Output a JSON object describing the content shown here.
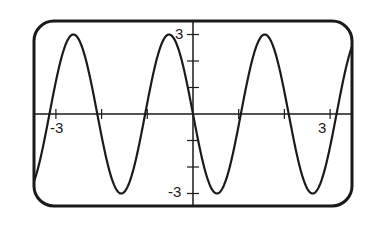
{
  "chart_data": {
    "type": "line",
    "title": "",
    "xlabel": "",
    "ylabel": "",
    "function": "y = -3 sin(3x)",
    "xlim": [
      -3.5,
      3.5
    ],
    "ylim": [
      -3.5,
      3.5
    ],
    "grid": false,
    "legend": null,
    "x_ticks": [
      -3,
      -2,
      -1,
      0,
      1,
      2,
      3
    ],
    "y_ticks": [
      -3,
      -2,
      -1,
      1,
      2,
      3
    ],
    "tick_labels": {
      "x_min": "-3",
      "x_max": "3",
      "y_max": "3",
      "y_min": "-3"
    },
    "amplitude": 3,
    "period": 2.094,
    "series": [
      {
        "name": "curve",
        "x": [
          -3.5,
          -3.0,
          -2.5,
          -2.0,
          -1.5,
          -1.0,
          -0.5,
          0.0,
          0.5,
          1.0,
          1.5,
          2.0,
          2.5,
          3.0,
          3.5
        ],
        "values": [
          -2.63,
          -1.24,
          2.81,
          -0.84,
          -2.93,
          0.42,
          2.99,
          0.0,
          -2.99,
          -0.42,
          2.93,
          0.84,
          -2.81,
          1.24,
          2.63
        ]
      }
    ],
    "colors": {
      "line": "#1a1a1a",
      "frame": "#1a1a1a",
      "background": "#ffffff"
    }
  }
}
